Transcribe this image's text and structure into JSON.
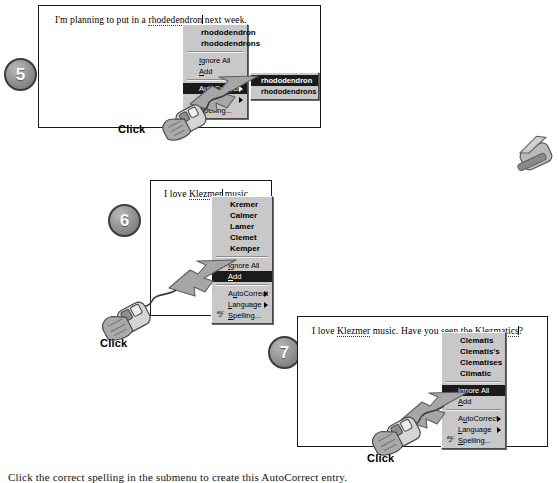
{
  "figure": {
    "caption": "Click the correct spelling in the submenu to create this AutoCorrect entry."
  },
  "colors": {
    "menu_face": "#c8c8c8",
    "menu_highlight": "#1b1b1b",
    "badge_fill": "#8f8f8f",
    "arrow_gray": "#9a9a9a",
    "text": "#000000"
  },
  "steps": [
    {
      "number": "5",
      "document_text": {
        "before": "I'm planning to put in a ",
        "misspelled": "rhodedendron",
        "after": " next week."
      },
      "menu": {
        "suggestions": [
          "rhododendron",
          "rhododendrons"
        ],
        "commands": [
          {
            "label": "Ignore All",
            "accel": "I",
            "highlight": false,
            "submenu": false
          },
          {
            "label": "Add",
            "accel": "A",
            "highlight": false,
            "submenu": false
          }
        ],
        "tools": [
          {
            "label": "AutoCorrect",
            "accel": "u",
            "highlight": true,
            "submenu": true
          },
          {
            "label": "Language",
            "accel": "L",
            "highlight": false,
            "submenu": true
          },
          {
            "label": "Spelling...",
            "accel": "S",
            "highlight": false,
            "submenu": false,
            "icon": "spell-check-icon"
          }
        ]
      },
      "submenu": {
        "items": [
          {
            "label": "rhododendron",
            "highlight": true
          },
          {
            "label": "rhododendrons",
            "highlight": false
          }
        ]
      },
      "click_label": "Click"
    },
    {
      "number": "6",
      "document_text": {
        "before": "I love ",
        "misspelled": "Klezmer",
        "after": " music."
      },
      "menu": {
        "suggestions": [
          "Kremer",
          "Calmer",
          "Lamer",
          "Clemet",
          "Kemper"
        ],
        "commands": [
          {
            "label": "Ignore All",
            "accel": "I",
            "highlight": false,
            "submenu": false
          },
          {
            "label": "Add",
            "accel": "A",
            "highlight": true,
            "submenu": false
          }
        ],
        "tools": [
          {
            "label": "AutoCorrect",
            "accel": "u",
            "highlight": false,
            "submenu": true
          },
          {
            "label": "Language",
            "accel": "L",
            "highlight": false,
            "submenu": true
          },
          {
            "label": "Spelling...",
            "accel": "S",
            "highlight": false,
            "submenu": false,
            "icon": "spell-check-icon"
          }
        ]
      },
      "submenu": null,
      "click_label": "Click"
    },
    {
      "number": "7",
      "document_text": {
        "before": "I love ",
        "misspelled": "Klezmer",
        "middle": " music. Have you seen the ",
        "misspelled2": "Klezmatics",
        "after": "?"
      },
      "menu": {
        "suggestions": [
          "Clematis",
          "Clematis's",
          "Clematises",
          "Climatic"
        ],
        "commands": [
          {
            "label": "Ignore All",
            "accel": "I",
            "highlight": true,
            "submenu": false
          },
          {
            "label": "Add",
            "accel": "A",
            "highlight": false,
            "submenu": false
          }
        ],
        "tools": [
          {
            "label": "AutoCorrect",
            "accel": "u",
            "highlight": false,
            "submenu": true
          },
          {
            "label": "Language",
            "accel": "L",
            "highlight": false,
            "submenu": true
          },
          {
            "label": "Spelling...",
            "accel": "S",
            "highlight": false,
            "submenu": false,
            "icon": "spell-check-icon"
          }
        ]
      },
      "submenu": null,
      "click_label": "Click"
    }
  ]
}
